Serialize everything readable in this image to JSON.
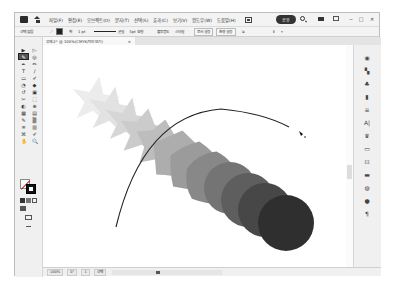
{
  "app": {
    "menu": [
      "파일(F)",
      "편집(E)",
      "오브젝트(O)",
      "문자(T)",
      "선택(S)",
      "효과(C)",
      "보기(V)",
      "윈도우(W)",
      "도움말(H)"
    ],
    "share_label": "공유",
    "window_controls": [
      "─",
      "□",
      "✕"
    ]
  },
  "control_bar": {
    "selection_label": "선택 없음",
    "stroke_label": "획",
    "stroke_weight": "1 pt",
    "brush_label": "균일",
    "point_label": "5pt 원형",
    "opacity_label": "불투명도",
    "style_label": "스타일",
    "doc_setup": "문서 설정",
    "preferences": "환경 설정"
  },
  "document_tab": {
    "title": "무제-2* @ 100%(CMYK/미리 보기)",
    "close": "×"
  },
  "tools": [
    "▶",
    "▷",
    "✎",
    "◎",
    "✒",
    "✏",
    "T",
    "/",
    "▭",
    "✐",
    "◔",
    "◆",
    "↺",
    "▣",
    "✂",
    "⬚",
    "◐",
    "⊕",
    "▦",
    "▤",
    "✎",
    "▒",
    "≡",
    "▥",
    "⌘",
    "✐",
    "✋",
    "🔍"
  ],
  "right_panels": [
    "◉",
    "▚",
    "♣",
    "▮",
    "≡",
    "A|",
    "♛",
    "▭",
    "⊡",
    "▬",
    "◍",
    "●",
    "¶"
  ],
  "status_bar": {
    "zoom": "100%",
    "rotation": "0°",
    "artboard": "1",
    "tool_name": "선택"
  },
  "canvas": {
    "blend_start_color": "#e9e9e9",
    "blend_end_color": "#2b2b2b",
    "steps": 12
  }
}
